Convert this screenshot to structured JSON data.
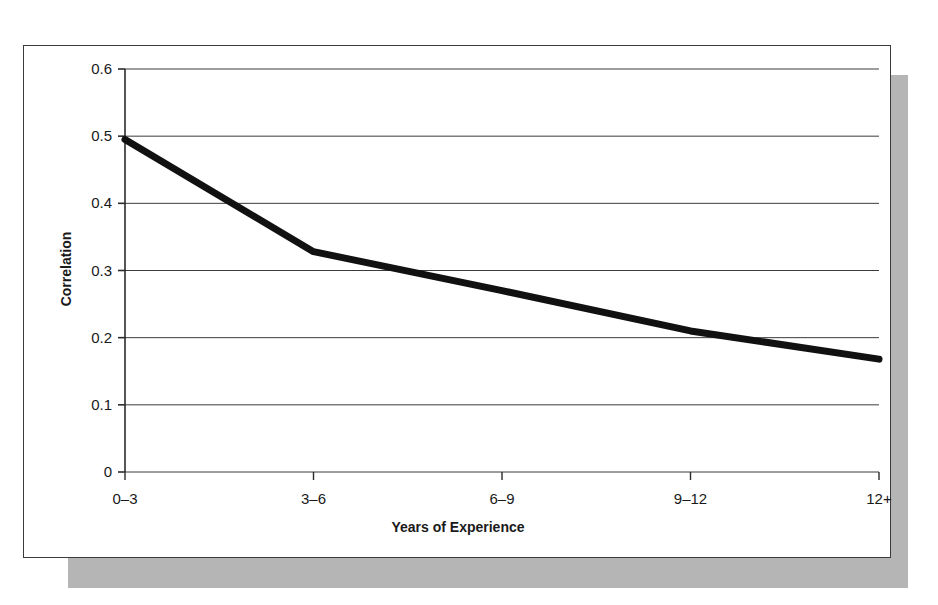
{
  "chart_data": {
    "type": "line",
    "title": "",
    "xlabel": "Years of Experience",
    "ylabel": "Correlation",
    "categories": [
      "0–3",
      "3–6",
      "6–9",
      "9–12",
      "12+"
    ],
    "values": [
      0.495,
      0.328,
      0.27,
      0.21,
      0.168
    ],
    "series": [
      {
        "name": "Correlation",
        "values": [
          0.495,
          0.328,
          0.27,
          0.21,
          0.168
        ],
        "color": "#111111",
        "line_width": 7
      }
    ],
    "ylim": [
      0,
      0.6
    ],
    "yticks": [
      "0",
      "0.1",
      "0.2",
      "0.3",
      "0.4",
      "0.5",
      "0.6"
    ],
    "ytick_values": [
      0,
      0.1,
      0.2,
      0.3,
      0.4,
      0.5,
      0.6
    ],
    "grid": "horizontal",
    "grid_color": "#3b3b3b",
    "legend": "none",
    "legend_position": "none",
    "axis_color": "#2b2b2b",
    "background": "#ffffff",
    "shadow_color": "#b5b5b5"
  },
  "figure": {
    "frame_border_color": "#3b3b3b",
    "has_drop_shadow": true
  }
}
